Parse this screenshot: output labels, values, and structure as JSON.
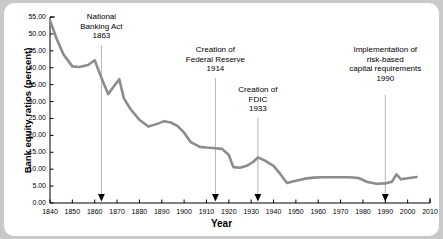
{
  "chart_data": {
    "type": "line",
    "title": "",
    "subtitle": "",
    "xlabel": "Year",
    "ylabel": "Bank equity ratios (percent)",
    "xlim": [
      1840,
      2010
    ],
    "ylim": [
      0.0,
      55.0
    ],
    "xticks": [
      1840,
      1850,
      1860,
      1870,
      1880,
      1890,
      1900,
      1910,
      1920,
      1930,
      1940,
      1950,
      1960,
      1970,
      1980,
      1990,
      2000,
      2010
    ],
    "xtick_labels": [
      "1840",
      "1850",
      "1860",
      "1870",
      "1880",
      "1890",
      "1900",
      "1910",
      "1920",
      "1930",
      "1940",
      "1950",
      "1960",
      "1970",
      "1980",
      "1990",
      "2000",
      "2010"
    ],
    "yticks": [
      0.0,
      5.0,
      10.0,
      15.0,
      20.0,
      25.0,
      30.0,
      35.0,
      40.0,
      45.0,
      50.0,
      55.0
    ],
    "ytick_labels": [
      "0.00",
      "5.00",
      "10.00",
      "15.00",
      "20.00",
      "25.00",
      "30.00",
      "35.00",
      "40.00",
      "45.00",
      "50.00",
      "55.00"
    ],
    "grid": false,
    "legend": null,
    "series": [
      {
        "name": "Bank equity ratio",
        "color": "#8c8c8c",
        "line_width": 2.6,
        "x": [
          1840,
          1843,
          1846,
          1850,
          1853,
          1857,
          1860,
          1863,
          1866,
          1868,
          1871,
          1873,
          1876,
          1880,
          1884,
          1888,
          1891,
          1894,
          1897,
          1900,
          1903,
          1907,
          1910,
          1914,
          1917,
          1920,
          1922,
          1925,
          1928,
          1931,
          1933,
          1936,
          1940,
          1943,
          1946,
          1950,
          1954,
          1958,
          1962,
          1966,
          1970,
          1974,
          1978,
          1982,
          1986,
          1990,
          1993,
          1995,
          1997,
          2000,
          2004
        ],
        "y": [
          54.0,
          48.5,
          44.0,
          40.4,
          40.2,
          40.8,
          42.2,
          37.0,
          32.2,
          34.0,
          36.6,
          31.0,
          27.8,
          24.6,
          22.6,
          23.4,
          24.2,
          23.8,
          22.8,
          20.8,
          18.0,
          16.6,
          16.4,
          16.2,
          16.0,
          14.2,
          10.6,
          10.4,
          11.0,
          12.2,
          13.5,
          12.6,
          11.0,
          8.6,
          5.9,
          6.6,
          7.2,
          7.5,
          7.6,
          7.6,
          7.6,
          7.6,
          7.4,
          6.2,
          5.7,
          5.8,
          6.3,
          8.5,
          7.0,
          7.3,
          7.7
        ]
      }
    ],
    "annotations": [
      {
        "id": "national-banking-act",
        "text": "National\nBanking Act\n1863",
        "year": 1863,
        "value_at_axis": 0.0,
        "marker": "down-arrow"
      },
      {
        "id": "federal-reserve",
        "text": "Creation of\nFederal Reserve\n1914",
        "year": 1914,
        "value_at_axis": 0.0,
        "marker": "down-arrow"
      },
      {
        "id": "fdic",
        "text": "Creation of\nFDIC\n1933",
        "year": 1933,
        "value_at_axis": 0.0,
        "marker": "down-arrow"
      },
      {
        "id": "risk-based-capital",
        "text": "Implementation of\nrisk-based\ncapital requirements\n1990",
        "year": 1990,
        "value_at_axis": 0.0,
        "marker": "down-arrow"
      }
    ]
  },
  "style": {
    "page_background": "#c9c9c9",
    "panel_background": "#ffffff",
    "axis_color": "#000000",
    "line_color": "#8c8c8c",
    "leader_color": "#b4b4b4",
    "text_color": "#000000"
  }
}
